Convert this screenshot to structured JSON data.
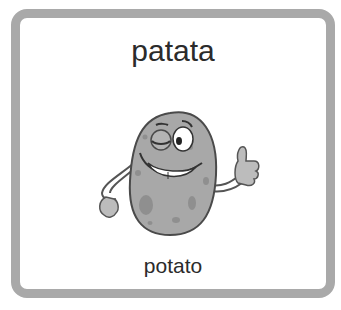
{
  "card": {
    "title": "patata",
    "subtitle": "potato",
    "illustration": "smiling-winking-potato-thumbs-up",
    "border_color": "#a9a9a9",
    "potato_color": "#a8a8a8",
    "spot_color": "#8f8f8f"
  }
}
